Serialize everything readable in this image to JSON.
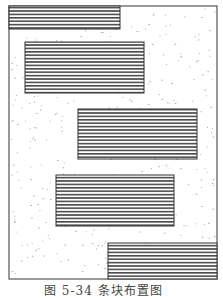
{
  "figure": {
    "caption": "图 5-34   条块布置图",
    "frame": {
      "x": 9,
      "y": 6,
      "w": 208,
      "h": 273
    },
    "colors": {
      "frame": "#555555",
      "stripe_dark": "#4a4a4a",
      "stripe_light": "#ffffff",
      "speckle": "#9a9a9a"
    },
    "blocks": [
      {
        "x": 9,
        "y": 6,
        "w": 111,
        "h": 23
      },
      {
        "x": 25,
        "y": 42,
        "w": 119,
        "h": 51
      },
      {
        "x": 78,
        "y": 109,
        "w": 119,
        "h": 50
      },
      {
        "x": 56,
        "y": 175,
        "w": 118,
        "h": 51
      },
      {
        "x": 108,
        "y": 243,
        "w": 109,
        "h": 36
      }
    ]
  }
}
